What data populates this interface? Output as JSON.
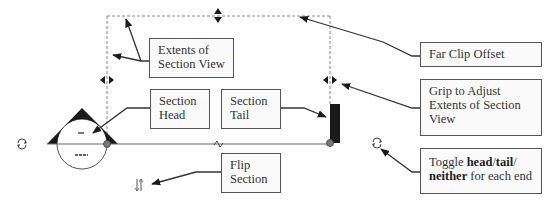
{
  "diagram": {
    "type": "section-view-annotation",
    "colors": {
      "line": "#555555",
      "dashed": "#888888",
      "symbol_fill": "#1a1a1a",
      "box_border": "#555555",
      "box_bg": "#fafafa",
      "text": "#333333",
      "grip_dot": "#777777"
    },
    "callouts": {
      "extents": {
        "line1": "Extents of",
        "line2": "Section View"
      },
      "head": {
        "line1": "Section",
        "line2": "Head"
      },
      "tail": {
        "line1": "Section",
        "line2": "Tail"
      },
      "flip": {
        "line1": "Flip",
        "line2": "Section"
      },
      "far_clip": {
        "label": "Far Clip Offset"
      },
      "grip": {
        "line1": "Grip to Adjust",
        "line2": "Extents of Section",
        "line3": "View"
      },
      "toggle": {
        "prefix": "Toggle ",
        "bold1": "head",
        "sep1": "/",
        "bold2": "tail",
        "sep2": "/",
        "bold3": "neither",
        "suffix": " for each end"
      }
    },
    "head_symbol": {
      "top_mark": "-",
      "bottom_mark": "---"
    },
    "icons": {
      "cycle_left": "cycle-arrows-icon",
      "cycle_right": "cycle-arrows-icon",
      "flip": "flip-arrows-icon",
      "break": "break-line-icon"
    }
  }
}
